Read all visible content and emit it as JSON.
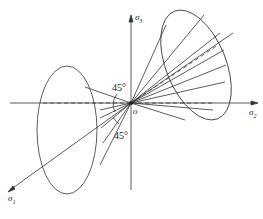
{
  "diagram": {
    "type": "principal stress space with two cones",
    "axes": {
      "sigma3": {
        "label": "σ",
        "sub": "3"
      },
      "sigma2": {
        "label": "σ",
        "sub": "2"
      },
      "sigma1": {
        "label": "σ",
        "sub": "1"
      }
    },
    "origin_label": "o",
    "angles": [
      {
        "label": "45°",
        "position": "upper-left of origin"
      },
      {
        "label": "45°",
        "position": "below-left of origin"
      }
    ],
    "caption": ""
  }
}
